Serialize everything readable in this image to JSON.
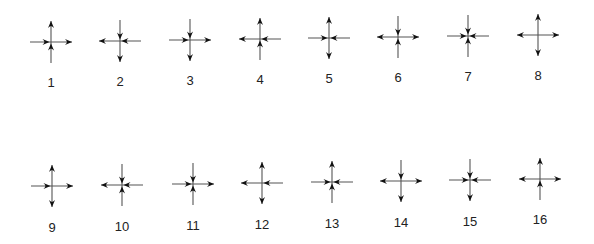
{
  "figure": {
    "arrow_color": "#111111",
    "line_color": "#555555",
    "glyphs": [
      {
        "label": "1",
        "cx": 51,
        "cy": 42,
        "ly": 87,
        "up": "out",
        "down": "in",
        "left": "in",
        "right": "out"
      },
      {
        "label": "2",
        "cx": 120,
        "cy": 41,
        "ly": 86,
        "up": "in",
        "down": "out",
        "left": "out",
        "right": "in"
      },
      {
        "label": "3",
        "cx": 190,
        "cy": 40,
        "ly": 85,
        "up": "in",
        "down": "out",
        "left": "in",
        "right": "out"
      },
      {
        "label": "4",
        "cx": 260,
        "cy": 39,
        "ly": 84,
        "up": "out",
        "down": "in",
        "left": "out",
        "right": "in"
      },
      {
        "label": "5",
        "cx": 329,
        "cy": 38,
        "ly": 83,
        "up": "out",
        "down": "out",
        "left": "in",
        "right": "in"
      },
      {
        "label": "6",
        "cx": 398,
        "cy": 37,
        "ly": 82,
        "up": "in",
        "down": "in",
        "left": "out",
        "right": "out"
      },
      {
        "label": "7",
        "cx": 468,
        "cy": 36,
        "ly": 81,
        "up": "in",
        "down": "in",
        "left": "in",
        "right": "in"
      },
      {
        "label": "8",
        "cx": 538,
        "cy": 35,
        "ly": 80,
        "up": "out",
        "down": "out",
        "left": "out",
        "right": "out"
      },
      {
        "label": "9",
        "cx": 52,
        "cy": 186,
        "ly": 232,
        "up": "out",
        "down": "out",
        "left": "in",
        "right": "out"
      },
      {
        "label": "10",
        "cx": 122,
        "cy": 185,
        "ly": 231,
        "up": "in",
        "down": "in",
        "left": "out",
        "right": "in"
      },
      {
        "label": "11",
        "cx": 193,
        "cy": 184,
        "ly": 230,
        "up": "in",
        "down": "in",
        "left": "in",
        "right": "out"
      },
      {
        "label": "12",
        "cx": 262,
        "cy": 183,
        "ly": 229,
        "up": "out",
        "down": "out",
        "left": "out",
        "right": "in"
      },
      {
        "label": "13",
        "cx": 332,
        "cy": 182,
        "ly": 228,
        "up": "out",
        "down": "in",
        "left": "in",
        "right": "in"
      },
      {
        "label": "14",
        "cx": 401,
        "cy": 181,
        "ly": 227,
        "up": "in",
        "down": "out",
        "left": "out",
        "right": "out"
      },
      {
        "label": "15",
        "cx": 470,
        "cy": 180,
        "ly": 226,
        "up": "in",
        "down": "out",
        "left": "in",
        "right": "in"
      },
      {
        "label": "16",
        "cx": 540,
        "cy": 179,
        "ly": 224,
        "up": "out",
        "down": "in",
        "left": "out",
        "right": "out"
      }
    ]
  }
}
